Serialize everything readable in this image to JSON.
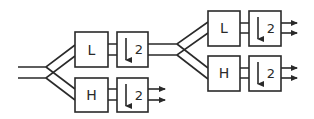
{
  "diagram": {
    "colors": {
      "stroke": "#2a2a2a",
      "background": "#ffffff"
    },
    "stage1": {
      "lowpass_label": "L",
      "highpass_label": "H",
      "downsample_low": "2",
      "downsample_high": "2"
    },
    "stage2": {
      "lowpass_label": "L",
      "highpass_label": "H",
      "downsample_low": "2",
      "downsample_high": "2"
    },
    "icons": {
      "downsample": "down-arrow-icon",
      "output": "right-arrow-icon"
    }
  }
}
